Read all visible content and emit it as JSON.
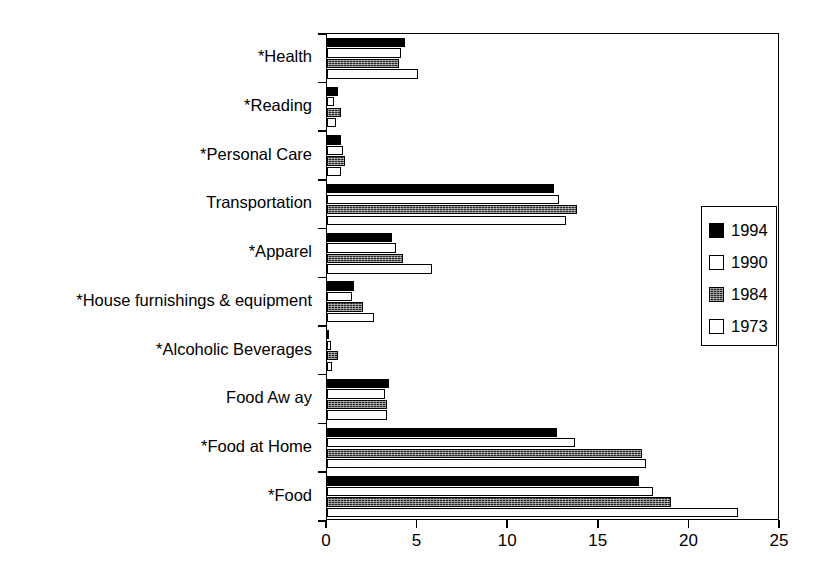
{
  "chart_data": {
    "type": "bar",
    "orientation": "horizontal",
    "title": "",
    "xlabel": "",
    "ylabel": "",
    "xlim": [
      0,
      25
    ],
    "xticks": [
      0,
      5,
      10,
      15,
      20,
      25
    ],
    "xtick_labels": [
      "0",
      "5",
      "10",
      "15",
      "20",
      "25"
    ],
    "grid": false,
    "legend_position": "right",
    "categories": [
      "*Health",
      "*Reading",
      "*Personal Care",
      "Transportation",
      "*Apparel",
      "*House furnishings & equipment",
      "*Alcoholic Beverages",
      "Food Aw ay",
      "*Food at Home",
      "*Food"
    ],
    "series": [
      {
        "name": "1994",
        "values": [
          4.3,
          0.6,
          0.8,
          12.5,
          3.6,
          1.5,
          0.1,
          3.4,
          12.7,
          17.2
        ]
      },
      {
        "name": "1990",
        "values": [
          4.1,
          0.4,
          0.9,
          12.8,
          3.8,
          1.4,
          0.2,
          3.2,
          13.7,
          18.0
        ]
      },
      {
        "name": "1984",
        "values": [
          4.0,
          0.8,
          1.0,
          13.8,
          4.2,
          2.0,
          0.6,
          3.3,
          17.4,
          19.0
        ]
      },
      {
        "name": "1973",
        "values": [
          5.0,
          0.5,
          0.8,
          13.2,
          5.8,
          2.6,
          0.3,
          3.3,
          17.6,
          22.7
        ]
      }
    ]
  },
  "legend": {
    "entries": [
      {
        "label": "1994",
        "swatch": "solid-black"
      },
      {
        "label": "1990",
        "swatch": "hollow-white"
      },
      {
        "label": "1984",
        "swatch": "dark-pattern"
      },
      {
        "label": "1973",
        "swatch": "hollow-white"
      }
    ]
  }
}
